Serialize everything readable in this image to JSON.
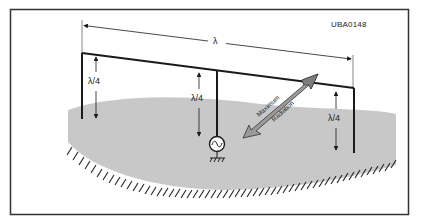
{
  "figure": {
    "id_label": "UBA0148",
    "colors": {
      "frame": "#333333",
      "wire": "#1a1a1a",
      "ground_fill": "#c8c8c8",
      "arrow_fill": "#9a9a9a",
      "hatch": "#222222"
    }
  },
  "dimensions": {
    "wavelength_label": "λ",
    "quarter_wave_labels": [
      "λ/4",
      "λ/4",
      "λ/4"
    ]
  },
  "radiation_arrow": {
    "label_upper": "Maximum",
    "label_lower": "Radiation"
  },
  "source": {
    "symbol": "~",
    "type": "ac-source",
    "ground": "ground-symbol"
  }
}
